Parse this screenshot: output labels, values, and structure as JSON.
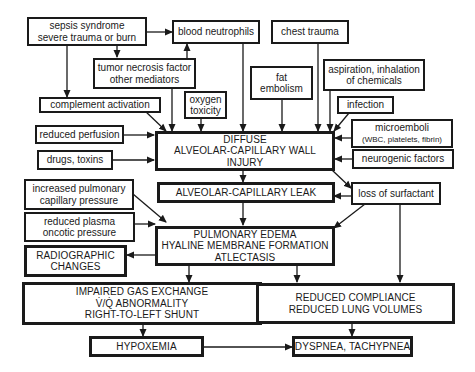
{
  "diagram": {
    "type": "flowchart",
    "colors": {
      "line": "#1a1a1a",
      "background": "#ffffff"
    },
    "nodes": {
      "sepsis": {
        "lines": [
          "sepsis syndrome",
          "severe trauma or burn"
        ]
      },
      "neutrophils": {
        "lines": [
          "blood neutrophils"
        ]
      },
      "chest_trauma": {
        "lines": [
          "chest trauma"
        ]
      },
      "tnf": {
        "lines": [
          "tumor necrosis factor",
          "other mediators"
        ]
      },
      "fat_embolism": {
        "lines": [
          "fat",
          "embolism"
        ]
      },
      "aspiration": {
        "lines": [
          "aspiration, inhalation",
          "of chemicals"
        ]
      },
      "complement": {
        "lines": [
          "complement activation"
        ]
      },
      "oxygen": {
        "lines": [
          "oxygen",
          "toxicity"
        ]
      },
      "infection": {
        "lines": [
          "infection"
        ]
      },
      "microemboli": {
        "lines": [
          "microemboli",
          "(WBC, platelets, fibrin)"
        ]
      },
      "perfusion": {
        "lines": [
          "reduced perfusion"
        ]
      },
      "drugs": {
        "lines": [
          "drugs, toxins"
        ]
      },
      "neurogenic": {
        "lines": [
          "neurogenic factors"
        ]
      },
      "injury": {
        "lines": [
          "DIFFUSE",
          "ALVEOLAR-CAPILLARY WALL",
          "INJURY"
        ]
      },
      "leak": {
        "lines": [
          "ALVEOLAR-CAPILLARY LEAK"
        ]
      },
      "surfactant": {
        "lines": [
          "loss of surfactant"
        ]
      },
      "pulm_pressure": {
        "lines": [
          "increased pulmonary",
          "capillary pressure"
        ]
      },
      "oncotic": {
        "lines": [
          "reduced plasma",
          "oncotic pressure"
        ]
      },
      "edema": {
        "lines": [
          "PULMONARY EDEMA",
          "HYALINE MEMBRANE FORMATION",
          "ATLECTASIS"
        ]
      },
      "radiographic": {
        "lines": [
          "RADIOGRAPHIC",
          "CHANGES"
        ]
      },
      "gas_exchange": {
        "lines": [
          "IMPAIRED GAS EXCHANGE",
          "V̇/Q̇ ABNORMALITY",
          "RIGHT-TO-LEFT SHUNT"
        ]
      },
      "compliance": {
        "lines": [
          "REDUCED COMPLIANCE",
          "REDUCED LUNG VOLUMES"
        ]
      },
      "hypoxemia": {
        "lines": [
          "HYPOXEMIA"
        ]
      },
      "dyspnea": {
        "lines": [
          "DYSPNEA, TACHYPNEA"
        ]
      }
    },
    "edges": [
      [
        "sepsis",
        "neutrophils"
      ],
      [
        "sepsis",
        "tnf"
      ],
      [
        "sepsis",
        "complement"
      ],
      [
        "tnf",
        "neutrophils"
      ],
      [
        "tnf",
        "injury"
      ],
      [
        "complement",
        "injury"
      ],
      [
        "oxygen",
        "injury"
      ],
      [
        "neutrophils",
        "injury"
      ],
      [
        "fat_embolism",
        "injury"
      ],
      [
        "chest_trauma",
        "injury"
      ],
      [
        "aspiration",
        "injury"
      ],
      [
        "infection",
        "injury"
      ],
      [
        "microemboli",
        "injury"
      ],
      [
        "neurogenic",
        "injury"
      ],
      [
        "perfusion",
        "injury"
      ],
      [
        "drugs",
        "injury"
      ],
      [
        "injury",
        "leak"
      ],
      [
        "injury",
        "surfactant"
      ],
      [
        "surfactant",
        "leak"
      ],
      [
        "surfactant",
        "edema"
      ],
      [
        "surfactant",
        "compliance"
      ],
      [
        "leak",
        "edema"
      ],
      [
        "pulm_pressure",
        "edema"
      ],
      [
        "oncotic",
        "edema"
      ],
      [
        "edema",
        "radiographic"
      ],
      [
        "edema",
        "gas_exchange"
      ],
      [
        "edema",
        "compliance"
      ],
      [
        "gas_exchange",
        "hypoxemia"
      ],
      [
        "compliance",
        "dyspnea"
      ],
      [
        "hypoxemia",
        "dyspnea"
      ]
    ]
  }
}
